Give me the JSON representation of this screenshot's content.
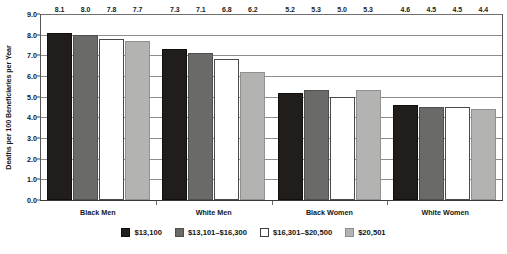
{
  "chart_data": {
    "type": "bar",
    "title": "",
    "xlabel": "",
    "ylabel": "Deaths per 100 Beneficiaries per Year",
    "ylim": [
      0,
      9
    ],
    "ytick_step": 1,
    "ytick_labels": [
      "0.0",
      "1.0",
      "2.0",
      "3.0",
      "4.0",
      "5.0",
      "6.0",
      "7.0",
      "8.0",
      "9.0"
    ],
    "grid": true,
    "legend_position": "bottom",
    "categories": [
      "Black Men",
      "White Men",
      "Black Women",
      "White Women"
    ],
    "series": [
      {
        "name": "$13,100",
        "color": "#201d1a",
        "values": [
          8.1,
          7.3,
          5.2,
          4.6
        ],
        "labels": [
          "8.1",
          "7.3",
          "5.2",
          "4.6"
        ]
      },
      {
        "name": "$13,101–$16,300",
        "color": "#6a6a68",
        "values": [
          8.0,
          7.1,
          5.3,
          4.5
        ],
        "labels": [
          "8.0",
          "7.1",
          "5.3",
          "4.5"
        ]
      },
      {
        "name": "$16,301–$20,500",
        "color": "#ffffff",
        "values": [
          7.8,
          6.8,
          5.0,
          4.5
        ],
        "labels": [
          "7.8",
          "6.8",
          "5.0",
          "4.5"
        ]
      },
      {
        "name": "$20,501",
        "color": "#b3b3b1",
        "values": [
          7.7,
          6.2,
          5.3,
          4.4
        ],
        "labels": [
          "7.7",
          "6.2",
          "5.3",
          "4.4"
        ]
      }
    ]
  }
}
